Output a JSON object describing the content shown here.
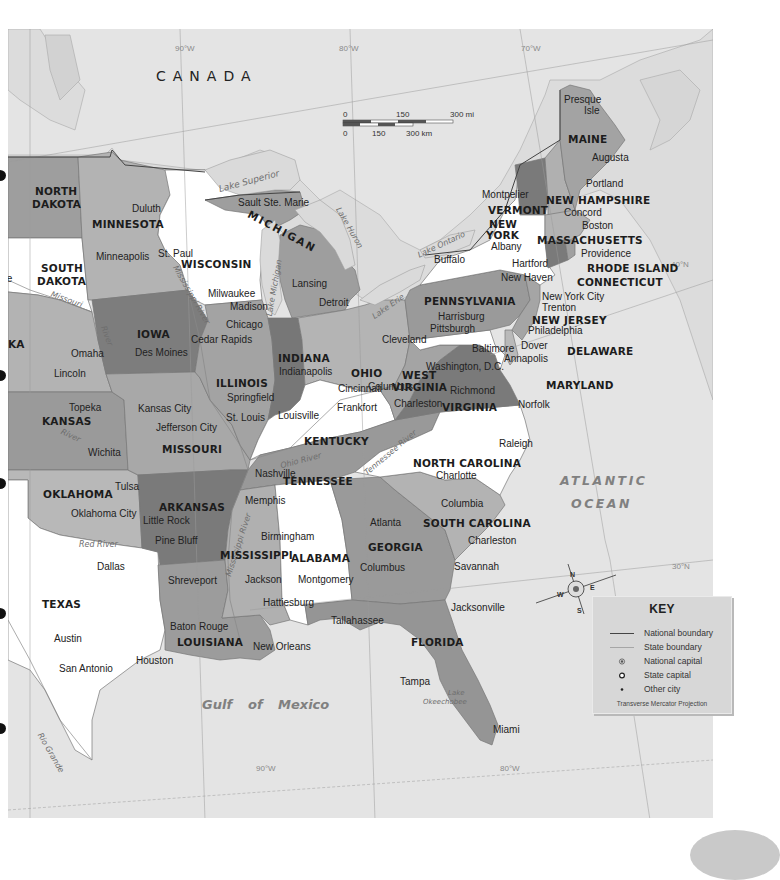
{
  "map": {
    "country_label": "CANADA",
    "water_bodies": {
      "atlantic_line1": "ATLANTIC",
      "atlantic_line2": "OCEAN",
      "gulf_word1": "Gulf",
      "gulf_word2": "of",
      "gulf_word3": "Mexico",
      "lake_superior": "Lake Superior",
      "lake_michigan": "Lake Michigan",
      "lake_huron": "Lake Huron",
      "lake_erie": "Lake Erie",
      "lake_ontario": "Lake Ontario",
      "lake_okeechobee_1": "Lake",
      "lake_okeechobee_2": "Okeechobee"
    },
    "rivers": {
      "missouri": "Missouri",
      "mississippi_upper": "Mississippi River",
      "mississippi_lower": "Mississippi River",
      "ohio": "Ohio River",
      "tennessee": "Tennessee River",
      "red": "Red River",
      "rio_grande": "Rio Grande",
      "arkansas": "River",
      "kansas": "River",
      "iowa_river": "River"
    },
    "gridlines": {
      "lon_90_top": "90°W",
      "lon_80_top": "80°W",
      "lon_70_top": "70°W",
      "lat_40": "40°N",
      "lat_30": "30°N",
      "lon_90_bottom": "90°W",
      "lon_80_bottom": "80°W"
    },
    "scale_bar": {
      "mi_0": "0",
      "mi_150": "150",
      "mi_300": "300 mi",
      "km_0": "0",
      "km_150": "150",
      "km_300": "300 km"
    },
    "compass": {
      "n": "N",
      "s": "S",
      "e": "E",
      "w": "W"
    },
    "states": {
      "north_dakota_1": "NORTH",
      "north_dakota_2": "DAKOTA",
      "south_dakota_1": "SOUTH",
      "south_dakota_2": "DAKOTA",
      "nebraska_partial": "KA",
      "kansas": "KANSAS",
      "oklahoma": "OKLAHOMA",
      "texas": "TEXAS",
      "minnesota": "MINNESOTA",
      "iowa": "IOWA",
      "missouri": "MISSOURI",
      "arkansas": "ARKANSAS",
      "louisiana": "LOUISIANA",
      "wisconsin": "WISCONSIN",
      "michigan": "MICHIGAN",
      "illinois": "ILLINOIS",
      "indiana": "INDIANA",
      "ohio": "OHIO",
      "kentucky": "KENTUCKY",
      "tennessee": "TENNESSEE",
      "mississippi": "MISSISSIPPI",
      "alabama": "ALABAMA",
      "georgia": "GEORGIA",
      "florida": "FLORIDA",
      "south_carolina": "SOUTH CAROLINA",
      "north_carolina": "NORTH CAROLINA",
      "virginia": "VIRGINIA",
      "west_virginia_1": "WEST",
      "west_virginia_2": "VIRGINIA",
      "maryland": "MARYLAND",
      "delaware": "DELAWARE",
      "pennsylvania": "PENNSYLVANIA",
      "new_jersey": "NEW JERSEY",
      "new_york_1": "NEW",
      "new_york_2": "YORK",
      "connecticut": "CONNECTICUT",
      "rhode_island": "RHODE ISLAND",
      "massachusetts": "MASSACHUSETTS",
      "vermont": "VERMONT",
      "new_hampshire": "NEW HAMPSHIRE",
      "maine": "MAINE"
    },
    "cities": {
      "bismarck_partial": "",
      "pierre_partial": "rre",
      "pierre_partial2": "y",
      "duluth": "Duluth",
      "minneapolis": "Minneapolis",
      "st_paul": "St. Paul",
      "sault_ste_marie": "Sault Ste. Marie",
      "milwaukee": "Milwaukee",
      "madison": "Madison",
      "lansing": "Lansing",
      "detroit": "Detroit",
      "chicago": "Chicago",
      "cedar_rapids": "Cedar Rapids",
      "des_moines": "Des Moines",
      "omaha": "Omaha",
      "lincoln": "Lincoln",
      "springfield": "Springfield",
      "indianapolis": "Indianapolis",
      "columbus_oh": "Columbus",
      "cleveland": "Cleveland",
      "buffalo": "Buffalo",
      "albany": "Albany",
      "montpelier": "Montpelier",
      "concord": "Concord",
      "boston": "Boston",
      "providence": "Providence",
      "hartford": "Hartford",
      "new_haven": "New Haven",
      "new_york_city": "New York City",
      "trenton": "Trenton",
      "philadelphia": "Philadelphia",
      "harrisburg": "Harrisburg",
      "pittsburgh": "Pittsburgh",
      "baltimore": "Baltimore",
      "annapolis": "Annapolis",
      "dover": "Dover",
      "washington_dc": "Washington, D.C.",
      "richmond": "Richmond",
      "norfolk": "Norfolk",
      "charleston_wv": "Charleston",
      "cincinnati": "Cincinnati",
      "frankfort": "Frankfort",
      "louisville": "Louisville",
      "st_louis": "St. Louis",
      "kansas_city": "Kansas City",
      "jefferson_city": "Jefferson City",
      "topeka": "Topeka",
      "wichita": "Wichita",
      "tulsa": "Tulsa",
      "oklahoma_city": "Oklahoma City",
      "little_rock": "Little Rock",
      "pine_bluff": "Pine Bluff",
      "memphis": "Memphis",
      "nashville": "Nashville",
      "raleigh": "Raleigh",
      "charlotte": "Charlotte",
      "columbia": "Columbia",
      "charleston_sc": "Charleston",
      "atlanta": "Atlanta",
      "savannah": "Savannah",
      "columbus_ga": "Columbus",
      "birmingham": "Birmingham",
      "montgomery": "Montgomery",
      "jackson": "Jackson",
      "hattiesburg": "Hattiesburg",
      "shreveport": "Shreveport",
      "dallas": "Dallas",
      "austin": "Austin",
      "san_antonio": "San Antonio",
      "houston": "Houston",
      "baton_rouge": "Baton Rouge",
      "new_orleans": "New Orleans",
      "tallahassee": "Tallahassee",
      "jacksonville": "Jacksonville",
      "tampa": "Tampa",
      "miami": "Miami",
      "presque_isle_1": "Presque",
      "presque_isle_2": "Isle",
      "augusta": "Augusta",
      "portland": "Portland"
    },
    "key": {
      "title": "KEY",
      "items": [
        {
          "symbol": "national-boundary-line",
          "label": "National boundary"
        },
        {
          "symbol": "state-boundary-line",
          "label": "State boundary"
        },
        {
          "symbol": "national-capital-dot",
          "label": "National capital"
        },
        {
          "symbol": "state-capital-ring",
          "label": "State capital"
        },
        {
          "symbol": "other-city-dot",
          "label": "Other city"
        }
      ],
      "projection": "Transverse Mercator Projection"
    },
    "colors": {
      "water": "#e4e4e4",
      "canada_land": "#dedede",
      "state_light": "#b3b3b3",
      "state_medium": "#9e9e9e",
      "state_dark": "#7a7a7a",
      "state_white": "#ffffff"
    }
  }
}
